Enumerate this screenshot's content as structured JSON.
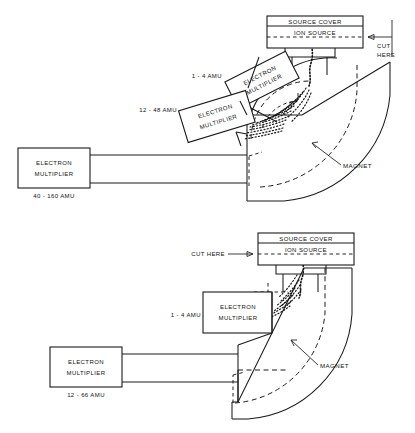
{
  "figure": {
    "background_color": "#ffffff",
    "line_color": "#1a1a1a"
  },
  "diagrams": [
    {
      "id": "top",
      "name": "three-multiplier-configuration",
      "source_cover": "SOURCE COVER",
      "ion_source": "ION SOURCE",
      "cut_here_line1": "CUT",
      "cut_here_line2": "HERE",
      "magnet_label": "MAGNET",
      "multipliers": [
        {
          "name": "multiplier-1-4-amu",
          "line1": "ELECTRON",
          "line2": "MULTIPLIER",
          "range": "1 - 4 AMU",
          "range_position": "left"
        },
        {
          "name": "multiplier-12-48-amu",
          "line1": "ELECTRON",
          "line2": "MULTIPLIER",
          "range": "12 - 48 AMU",
          "range_position": "left"
        },
        {
          "name": "multiplier-40-160-amu",
          "line1": "ELECTRON",
          "line2": "MULTIPLIER",
          "range": "40 - 160  AMU",
          "range_position": "below"
        }
      ]
    },
    {
      "id": "bottom",
      "name": "two-multiplier-configuration",
      "source_cover": "SOURCE COVER",
      "ion_source": "ION SOURCE",
      "cut_here": "CUT  HERE",
      "magnet_label": "MAGNET",
      "multipliers": [
        {
          "name": "multiplier-1-4-amu",
          "line1": "ELECTRON",
          "line2": "MULTIPLIER",
          "range": "1 - 4 AMU",
          "range_position": "left"
        },
        {
          "name": "multiplier-12-66-amu",
          "line1": "ELECTRON",
          "line2": "MULTIPLIER",
          "range": "12 - 66  AMU",
          "range_position": "below"
        }
      ]
    }
  ]
}
